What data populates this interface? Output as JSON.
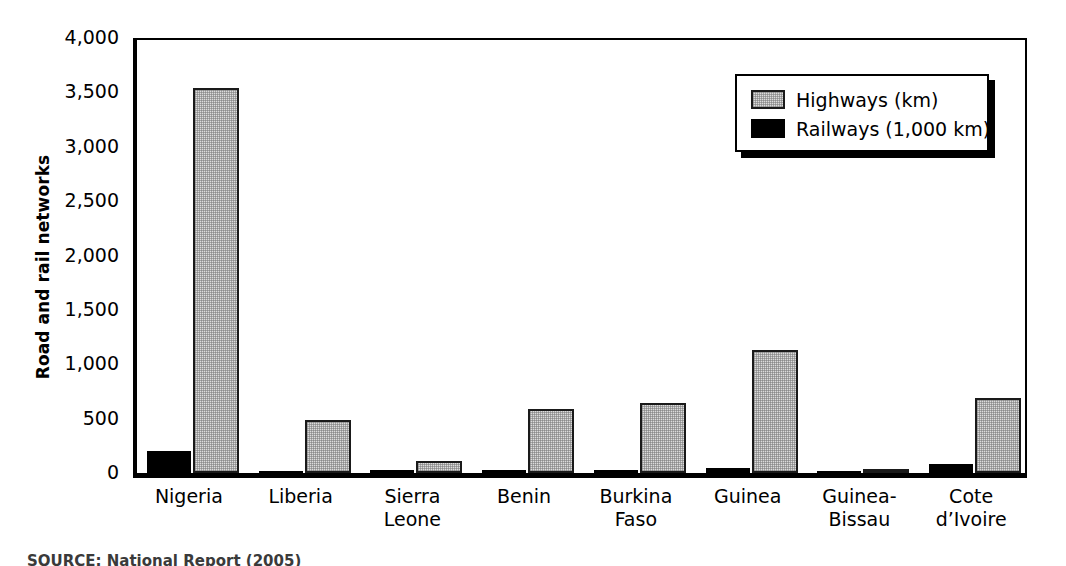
{
  "chart_data": {
    "type": "bar",
    "title": "",
    "subtitle": "",
    "xlabel": "",
    "ylabel": "Road and rail networks",
    "categories": [
      "Nigeria",
      "Liberia",
      "Sierra\nLeone",
      "Benin",
      "Burkina\nFaso",
      "Guinea",
      "Guinea-\nBissau",
      "Cote\nd’Ivoire"
    ],
    "series": [
      {
        "name": "Railways (1,000 km)",
        "color": "#000000",
        "values": [
          200,
          20,
          25,
          25,
          25,
          45,
          20,
          80
        ]
      },
      {
        "name": "Highways (km)",
        "color": "#dcdcdc",
        "values": [
          3540,
          490,
          110,
          590,
          640,
          1130,
          30,
          690
        ]
      }
    ],
    "ylim": [
      0,
      4000
    ],
    "yticks": [
      0,
      500,
      1000,
      1500,
      2000,
      2500,
      3000,
      3500,
      4000
    ],
    "ytick_labels": [
      "0",
      "500",
      "1,000",
      "1,500",
      "2,000",
      "2,500",
      "3,000",
      "3,500",
      "4,000"
    ],
    "grid": false,
    "legend_position": "top-right",
    "legend_entries": [
      "Highways (km)",
      "Railways (1,000 km)"
    ],
    "bar_order_within_group": [
      "Railways (1,000 km)",
      "Highways (km)"
    ]
  },
  "legend": {
    "entries": [
      {
        "label": "Highways (km)",
        "swatch": "highway"
      },
      {
        "label": "Railways (1,000 km)",
        "swatch": "railway"
      }
    ]
  },
  "source": {
    "text": "SOURCE: National Report (2005)"
  }
}
